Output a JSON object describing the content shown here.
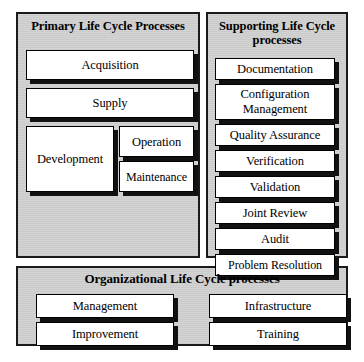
{
  "diagram": {
    "colors": {
      "panel_background": "#d2d2d2",
      "box_background": "#ffffff",
      "border": "#000000",
      "shadow": "#111111",
      "page_background": "#ffffff"
    },
    "panels": [
      {
        "id": "primary",
        "title": "Primary Life Cycle Processes",
        "title_line1": "Primary Life Cycle",
        "title_line2": "Processes",
        "boxes": [
          {
            "label": "Acquisition"
          },
          {
            "label": "Supply"
          },
          {
            "label": "Development"
          },
          {
            "label": "Operation"
          },
          {
            "label": "Maintenance"
          }
        ]
      },
      {
        "id": "supporting",
        "title": "Supporting Life Cycle processes",
        "title_line1": "Supporting Life",
        "title_line2": "Cycle processes",
        "boxes": [
          {
            "label": "Documentation"
          },
          {
            "label": "Configuration Management",
            "line1": "Configuration",
            "line2": "Management"
          },
          {
            "label": "Quality Assurance"
          },
          {
            "label": "Verification"
          },
          {
            "label": "Validation"
          },
          {
            "label": "Joint Review"
          },
          {
            "label": "Audit"
          },
          {
            "label": "Problem Resolution"
          }
        ]
      },
      {
        "id": "organizational",
        "title": "Organizational Life Cycle processes",
        "boxes": [
          {
            "label": "Management"
          },
          {
            "label": "Improvement"
          },
          {
            "label": "Infrastructure"
          },
          {
            "label": "Training"
          }
        ]
      }
    ]
  }
}
